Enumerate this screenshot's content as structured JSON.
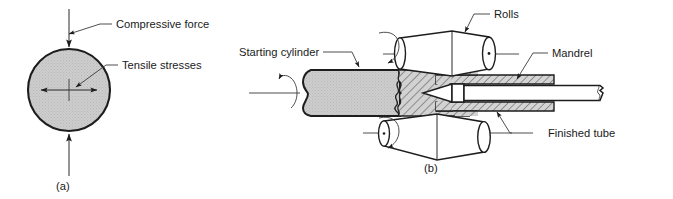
{
  "figure": {
    "background_color": "#ffffff",
    "ink_color": "#1a1a1a",
    "fill_gray": "#c9c9c9",
    "hatch_gray": "#cfcfcf",
    "panels": [
      {
        "id": "a",
        "caption": "(a)",
        "description": "Solid round bar under diametral compression developing tensile stresses at the center",
        "labels": [
          {
            "id": "compressive-force",
            "text": "Compressive force"
          },
          {
            "id": "tensile-stresses",
            "text": "Tensile stresses"
          }
        ]
      },
      {
        "id": "b",
        "caption": "(b)",
        "description": "Rotary tube piercing with two barrel rolls and a mandrel forming a finished tube",
        "labels": [
          {
            "id": "starting-cylinder",
            "text": "Starting cylinder"
          },
          {
            "id": "rolls",
            "text": "Rolls"
          },
          {
            "id": "mandrel",
            "text": "Mandrel"
          },
          {
            "id": "finished-tube",
            "text": "Finished tube"
          }
        ]
      }
    ]
  },
  "panel_a": {
    "caption": "(a)",
    "compressive_force_label": "Compressive force",
    "tensile_stresses_label": "Tensile stresses"
  },
  "panel_b": {
    "caption": "(b)",
    "starting_cylinder_label": "Starting cylinder",
    "rolls_label": "Rolls",
    "mandrel_label": "Mandrel",
    "finished_tube_label": "Finished tube"
  }
}
